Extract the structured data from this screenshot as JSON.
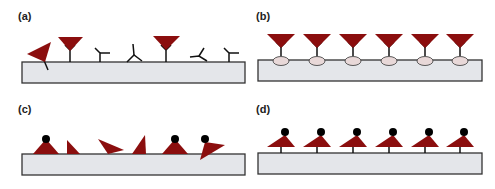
{
  "panels": [
    {
      "id": "a",
      "label": "(a)",
      "description": "Randomly oriented antibodies adsorbed on surface, some binding antigen"
    },
    {
      "id": "b",
      "label": "(b)",
      "description": "Oriented antibodies immobilized via binding proteins, all binding antigen"
    },
    {
      "id": "c",
      "label": "(c)",
      "description": "Randomly oriented molecules with tags on surface"
    },
    {
      "id": "d",
      "label": "(d)",
      "description": "Uniformly oriented tagged molecules on surface"
    }
  ],
  "colors": {
    "antigen": "#8b0e0e",
    "substrate_fill": "#e4e6ea",
    "substrate_stroke": "#333333",
    "linker": "#111111",
    "binding_protein": "#e8d8d8",
    "tag": "#000000"
  }
}
